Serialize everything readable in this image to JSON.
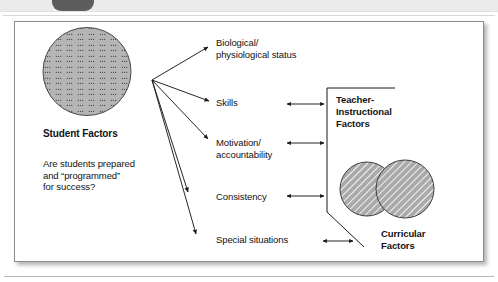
{
  "chrome": {
    "tab_label": "",
    "strip_name": "page-header-strip"
  },
  "figure": {
    "left_node": {
      "title": "Student Factors",
      "question": "Are students prepared\nand “programmed”\nfor success?",
      "shape": "stippled-circle"
    },
    "factors": [
      {
        "id": "biological",
        "label": "Biological/\nphysiological status"
      },
      {
        "id": "skills",
        "label": "Skills"
      },
      {
        "id": "motivation",
        "label": "Motivation/\naccountability"
      },
      {
        "id": "consistency",
        "label": "Consistency"
      },
      {
        "id": "special",
        "label": "Special situations"
      }
    ],
    "right_nodes": [
      {
        "id": "teacher",
        "label": "Teacher-\nInstructional\nFactors",
        "shape": "bracket"
      },
      {
        "id": "curricular",
        "label": "Curricular\nFactors",
        "shape": "hatched-venn"
      }
    ],
    "connectors": {
      "fan_arrows": 5,
      "double_arrows": 3,
      "fan_origin": {
        "x": 152,
        "y": 80
      }
    }
  },
  "colors": {
    "frame_border": "#8c8c8c",
    "text": "#121212",
    "circle_fill": "#b3b3b3",
    "venn_fill": "#a8a8a8",
    "chrome_strip": "#ebebeb",
    "chrome_tab": "#5d5d5d",
    "line": "#1a1a1a"
  }
}
